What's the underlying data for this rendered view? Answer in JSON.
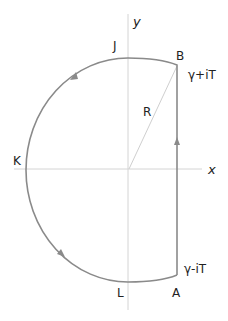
{
  "diagram": {
    "axes": {
      "x_label": "x",
      "y_label": "y"
    },
    "points": {
      "J": "J",
      "B": "B",
      "K": "K",
      "L": "L",
      "A": "A"
    },
    "annotations": {
      "upper": "γ+iT",
      "lower": "γ-iT",
      "radius": "R"
    },
    "colors": {
      "contour": "#8a8a8a",
      "axes": "#d0d0d0",
      "radius_line": "#c8c8c8",
      "text": "#222222"
    }
  }
}
